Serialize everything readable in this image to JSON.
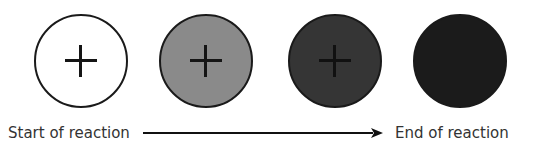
{
  "diagram": {
    "type": "reaction-progress",
    "circles": [
      {
        "stage": 1,
        "fill": "#ffffff",
        "has_plus": true,
        "plus_color": "#151515"
      },
      {
        "stage": 2,
        "fill": "#8a8a8a",
        "has_plus": true,
        "plus_color": "#151515"
      },
      {
        "stage": 3,
        "fill": "#353535",
        "has_plus": true,
        "plus_color": "#111111"
      },
      {
        "stage": 4,
        "fill": "#1b1b1b",
        "has_plus": false
      }
    ],
    "start_label": "Start of reaction",
    "end_label": "End of reaction",
    "arrow_direction": "right"
  }
}
